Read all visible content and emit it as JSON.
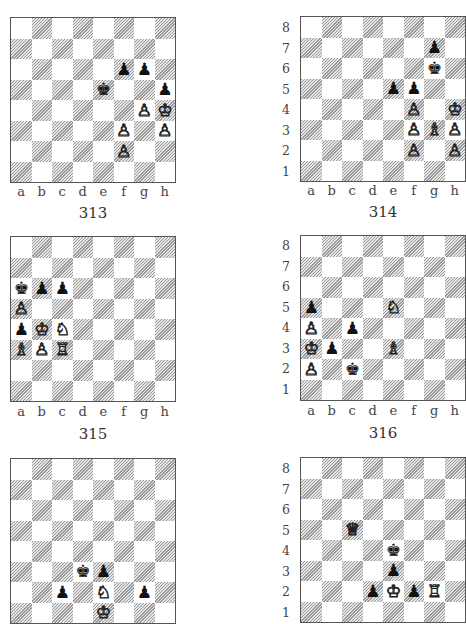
{
  "files": [
    "a",
    "b",
    "c",
    "d",
    "e",
    "f",
    "g",
    "h"
  ],
  "ranks": [
    "8",
    "7",
    "6",
    "5",
    "4",
    "3",
    "2",
    "1"
  ],
  "glyphs": {
    "K": "♔",
    "Q": "♕",
    "R": "♖",
    "B": "♗",
    "N": "♘",
    "P": "♙",
    "k": "♚",
    "q": "♛",
    "r": "♜",
    "b": "♝",
    "n": "♞",
    "p": "♟"
  },
  "colors": {
    "light_square": "#ffffff",
    "dark_square_hatch": "#9a9a9a",
    "border": "#555555"
  },
  "diagrams": [
    {
      "number": "313",
      "show_ranks": false,
      "show_files": true,
      "pieces": [
        {
          "sq": "f6",
          "p": "p"
        },
        {
          "sq": "g6",
          "p": "p"
        },
        {
          "sq": "e5",
          "p": "k"
        },
        {
          "sq": "h5",
          "p": "p"
        },
        {
          "sq": "g4",
          "p": "P"
        },
        {
          "sq": "h4",
          "p": "K"
        },
        {
          "sq": "f3",
          "p": "P"
        },
        {
          "sq": "h3",
          "p": "P"
        },
        {
          "sq": "f2",
          "p": "P"
        }
      ]
    },
    {
      "number": "314",
      "show_ranks": true,
      "show_files": true,
      "pieces": [
        {
          "sq": "g7",
          "p": "p"
        },
        {
          "sq": "g6",
          "p": "k"
        },
        {
          "sq": "e5",
          "p": "p"
        },
        {
          "sq": "f5",
          "p": "p"
        },
        {
          "sq": "f4",
          "p": "P"
        },
        {
          "sq": "h4",
          "p": "K"
        },
        {
          "sq": "f3",
          "p": "P"
        },
        {
          "sq": "g3",
          "p": "B"
        },
        {
          "sq": "h3",
          "p": "P"
        },
        {
          "sq": "f2",
          "p": "P"
        },
        {
          "sq": "h2",
          "p": "P"
        }
      ]
    },
    {
      "number": "315",
      "show_ranks": false,
      "show_files": true,
      "pieces": [
        {
          "sq": "a6",
          "p": "k"
        },
        {
          "sq": "b6",
          "p": "p"
        },
        {
          "sq": "c6",
          "p": "p"
        },
        {
          "sq": "a5",
          "p": "P"
        },
        {
          "sq": "a4",
          "p": "p"
        },
        {
          "sq": "b4",
          "p": "K"
        },
        {
          "sq": "c4",
          "p": "N"
        },
        {
          "sq": "a3",
          "p": "B"
        },
        {
          "sq": "b3",
          "p": "P"
        },
        {
          "sq": "c3",
          "p": "R"
        }
      ]
    },
    {
      "number": "316",
      "show_ranks": true,
      "show_files": true,
      "pieces": [
        {
          "sq": "a5",
          "p": "p"
        },
        {
          "sq": "e5",
          "p": "N"
        },
        {
          "sq": "a4",
          "p": "P"
        },
        {
          "sq": "c4",
          "p": "p"
        },
        {
          "sq": "a3",
          "p": "K"
        },
        {
          "sq": "b3",
          "p": "p"
        },
        {
          "sq": "e3",
          "p": "B"
        },
        {
          "sq": "a2",
          "p": "P"
        },
        {
          "sq": "c2",
          "p": "k"
        }
      ]
    },
    {
      "number": "",
      "show_ranks": false,
      "show_files": false,
      "pieces": [
        {
          "sq": "d3",
          "p": "k"
        },
        {
          "sq": "e3",
          "p": "p"
        },
        {
          "sq": "c2",
          "p": "p"
        },
        {
          "sq": "e2",
          "p": "N"
        },
        {
          "sq": "g2",
          "p": "p"
        },
        {
          "sq": "e1",
          "p": "K"
        }
      ]
    },
    {
      "number": "",
      "show_ranks": true,
      "show_files": false,
      "pieces": [
        {
          "sq": "c5",
          "p": "Q"
        },
        {
          "sq": "e4",
          "p": "k"
        },
        {
          "sq": "e3",
          "p": "p"
        },
        {
          "sq": "d2",
          "p": "p"
        },
        {
          "sq": "e2",
          "p": "K"
        },
        {
          "sq": "f2",
          "p": "p"
        },
        {
          "sq": "g2",
          "p": "R"
        }
      ]
    }
  ]
}
